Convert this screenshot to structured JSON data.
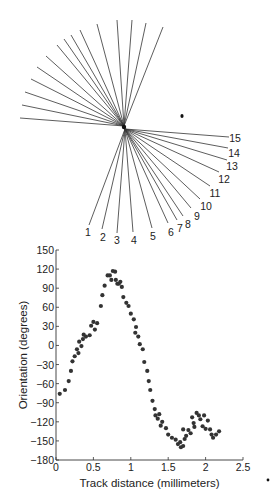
{
  "chart_data": [
    {
      "type": "diagram",
      "title": "",
      "description": "Fan of orientation lines through a common center; lower half rays labeled 1-15",
      "center": [
        124,
        126
      ],
      "upper_rays_end": [
        [
          20,
          118
        ],
        [
          22,
          105
        ],
        [
          25,
          92
        ],
        [
          31,
          79
        ],
        [
          37,
          67
        ],
        [
          46,
          56
        ],
        [
          57,
          45
        ],
        [
          64,
          39
        ],
        [
          71,
          35
        ],
        [
          80,
          30
        ],
        [
          97,
          24
        ],
        [
          117,
          20
        ],
        [
          132,
          20
        ],
        [
          146,
          23
        ],
        [
          163,
          27
        ]
      ],
      "lower_rays": [
        {
          "label": "1",
          "end": [
            89,
            225
          ],
          "label_pos": [
            88,
            236
          ]
        },
        {
          "label": "2",
          "end": [
            102,
            229
          ],
          "label_pos": [
            103,
            241
          ]
        },
        {
          "label": "3",
          "end": [
            117,
            233
          ],
          "label_pos": [
            117,
            244
          ]
        },
        {
          "label": "4",
          "end": [
            133,
            232
          ],
          "label_pos": [
            134,
            244
          ]
        },
        {
          "label": "5",
          "end": [
            152,
            228
          ],
          "label_pos": [
            153,
            240
          ]
        },
        {
          "label": "6",
          "end": [
            168,
            223
          ],
          "label_pos": [
            171,
            236
          ]
        },
        {
          "label": "7",
          "end": [
            177,
            220
          ],
          "label_pos": [
            180,
            232
          ]
        },
        {
          "label": "8",
          "end": [
            183,
            216
          ],
          "label_pos": [
            188,
            228
          ]
        },
        {
          "label": "9",
          "end": [
            191,
            208
          ],
          "label_pos": [
            197,
            220
          ]
        },
        {
          "label": "10",
          "end": [
            200,
            199
          ],
          "label_pos": [
            206,
            210
          ]
        },
        {
          "label": "11",
          "end": [
            210,
            186
          ],
          "label_pos": [
            215,
            197
          ]
        },
        {
          "label": "12",
          "end": [
            219,
            172
          ],
          "label_pos": [
            224,
            183
          ]
        },
        {
          "label": "13",
          "end": [
            227,
            160
          ],
          "label_pos": [
            232,
            170
          ]
        },
        {
          "label": "14",
          "end": [
            228,
            148
          ],
          "label_pos": [
            234,
            157
          ]
        },
        {
          "label": "15",
          "end": [
            229,
            137
          ],
          "label_pos": [
            235,
            142
          ]
        }
      ],
      "annotation_dot": [
        182,
        116
      ]
    },
    {
      "type": "scatter",
      "title": "",
      "xlabel": "Track distance (millimeters)",
      "ylabel": "Orientation (degrees)",
      "xlim": [
        0,
        2.5
      ],
      "ylim": [
        -180,
        150
      ],
      "xticks": [
        "0",
        "0.5",
        "1",
        "1.5",
        "2",
        "2.5"
      ],
      "yticks": [
        "150",
        "120",
        "90",
        "60",
        "30",
        "0",
        "−30",
        "−60",
        "−90",
        "−120",
        "−150",
        "−180"
      ],
      "grid": false,
      "legend": null,
      "points": [
        [
          0.05,
          -76
        ],
        [
          0.12,
          -70
        ],
        [
          0.17,
          -56
        ],
        [
          0.2,
          -40
        ],
        [
          0.22,
          -25
        ],
        [
          0.25,
          -17
        ],
        [
          0.28,
          -6
        ],
        [
          0.3,
          -12
        ],
        [
          0.31,
          6
        ],
        [
          0.34,
          -1
        ],
        [
          0.36,
          10
        ],
        [
          0.37,
          17
        ],
        [
          0.4,
          14
        ],
        [
          0.45,
          16
        ],
        [
          0.47,
          31
        ],
        [
          0.5,
          37
        ],
        [
          0.52,
          25
        ],
        [
          0.55,
          35
        ],
        [
          0.6,
          62
        ],
        [
          0.62,
          79
        ],
        [
          0.65,
          94
        ],
        [
          0.69,
          110
        ],
        [
          0.72,
          110
        ],
        [
          0.74,
          103
        ],
        [
          0.76,
          117
        ],
        [
          0.79,
          116
        ],
        [
          0.8,
          103
        ],
        [
          0.82,
          97
        ],
        [
          0.84,
          97
        ],
        [
          0.86,
          100
        ],
        [
          0.88,
          92
        ],
        [
          0.9,
          76
        ],
        [
          0.94,
          67
        ],
        [
          0.97,
          62
        ],
        [
          1.0,
          50
        ],
        [
          1.04,
          41
        ],
        [
          1.06,
          20
        ],
        [
          1.07,
          29
        ],
        [
          1.1,
          14
        ],
        [
          1.12,
          2
        ],
        [
          1.16,
          -6
        ],
        [
          1.18,
          -26
        ],
        [
          1.22,
          -40
        ],
        [
          1.24,
          -56
        ],
        [
          1.26,
          -70
        ],
        [
          1.29,
          -87
        ],
        [
          1.32,
          -100
        ],
        [
          1.33,
          -110
        ],
        [
          1.36,
          -115
        ],
        [
          1.38,
          -108
        ],
        [
          1.4,
          -126
        ],
        [
          1.42,
          -120
        ],
        [
          1.47,
          -130
        ],
        [
          1.5,
          -140
        ],
        [
          1.55,
          -145
        ],
        [
          1.6,
          -148
        ],
        [
          1.63,
          -155
        ],
        [
          1.66,
          -152
        ],
        [
          1.67,
          -160
        ],
        [
          1.7,
          -158
        ],
        [
          1.7,
          -132
        ],
        [
          1.72,
          -147
        ],
        [
          1.74,
          -142
        ],
        [
          1.77,
          -133
        ],
        [
          1.8,
          -138
        ],
        [
          1.82,
          -113
        ],
        [
          1.84,
          -122
        ],
        [
          1.85,
          -128
        ],
        [
          1.88,
          -106
        ],
        [
          1.91,
          -110
        ],
        [
          1.93,
          -116
        ],
        [
          1.96,
          -127
        ],
        [
          1.98,
          -110
        ],
        [
          2.0,
          -131
        ],
        [
          2.03,
          -118
        ],
        [
          2.06,
          -132
        ],
        [
          2.08,
          -140
        ],
        [
          2.1,
          -145
        ],
        [
          2.14,
          -140
        ],
        [
          2.18,
          -135
        ]
      ],
      "stray_mark": [
        268,
        480
      ],
      "marker_color": "#333333"
    }
  ]
}
